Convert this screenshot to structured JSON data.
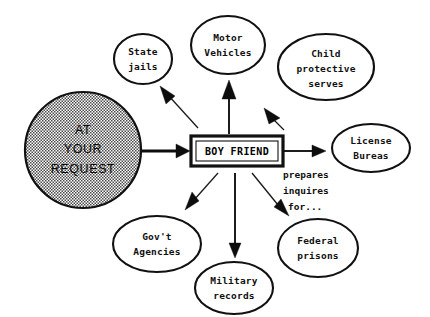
{
  "diagram": {
    "background_color": "#ffffff",
    "ink_color": "#111111",
    "source": {
      "shape": "circle",
      "fill_pattern": "halftone-dots",
      "lines": [
        "AT",
        "YOUR",
        "REQUEST"
      ]
    },
    "hub": {
      "shape": "double-border-rectangle",
      "label": "BOY FRIEND"
    },
    "edge_annotation": {
      "lines": [
        "prepares",
        "inquires",
        "for..."
      ]
    },
    "targets": [
      {
        "id": "state-jails",
        "lines": [
          "State",
          "jails"
        ]
      },
      {
        "id": "motor-vehicles",
        "lines": [
          "Motor",
          "Vehicles"
        ]
      },
      {
        "id": "child-protective-serves",
        "lines": [
          "Child",
          "protective",
          "serves"
        ]
      },
      {
        "id": "license-bureas",
        "lines": [
          "License",
          "Bureas"
        ]
      },
      {
        "id": "federal-prisons",
        "lines": [
          "Federal",
          "prisons"
        ]
      },
      {
        "id": "military-records",
        "lines": [
          "Military",
          "records"
        ]
      },
      {
        "id": "govt-agencies",
        "lines": [
          "Gov't",
          "Agencies"
        ]
      }
    ]
  }
}
